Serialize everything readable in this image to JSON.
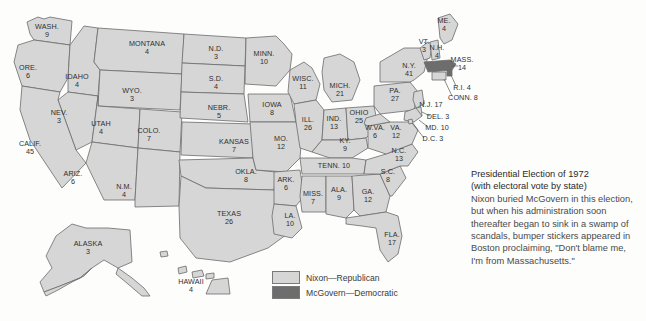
{
  "figure": {
    "title": "Presidential Election of 1972",
    "subtitle": "(with electoral vote by state)",
    "body": "Nixon buried McGovern in this election, but when his administration soon thereafter began to sink in a swamp of scandals, bumper stickers appeared in Boston proclaiming, \"Don't blame me, I'm from Massachusetts.\""
  },
  "legend": {
    "items": [
      {
        "label": "Nixon—Republican",
        "swatch": "rep",
        "color": "#d6d6d6"
      },
      {
        "label": "McGovern—Democratic",
        "swatch": "dem",
        "color": "#6d6d6d"
      }
    ]
  },
  "colors": {
    "republican": "#d6d6d6",
    "democratic": "#6d6d6d",
    "border": "#6b6b6b",
    "background": "#fdfdfc",
    "text": "#2e2e2e"
  },
  "chart_data": {
    "type": "map",
    "title": "Presidential Election of 1972",
    "subtitle": "(with electoral vote by state)",
    "value_label": "electoral votes",
    "categories": [
      "Nixon—Republican",
      "McGovern—Democratic"
    ],
    "states": [
      {
        "name": "WASH.",
        "votes": 9,
        "winner": "Nixon",
        "x": 47,
        "y": 31
      },
      {
        "name": "ORE.",
        "votes": 6,
        "winner": "Nixon",
        "x": 28,
        "y": 72
      },
      {
        "name": "IDAHO",
        "votes": 4,
        "winner": "Nixon",
        "x": 77,
        "y": 81
      },
      {
        "name": "MONTANA",
        "votes": 4,
        "winner": "Nixon",
        "x": 147,
        "y": 48
      },
      {
        "name": "WYO.",
        "votes": 3,
        "winner": "Nixon",
        "x": 132,
        "y": 95
      },
      {
        "name": "NEV.",
        "votes": 3,
        "winner": "Nixon",
        "x": 59,
        "y": 117
      },
      {
        "name": "UTAH",
        "votes": 4,
        "winner": "Nixon",
        "x": 101,
        "y": 128
      },
      {
        "name": "CALIF.",
        "votes": 45,
        "winner": "Nixon",
        "x": 30,
        "y": 148
      },
      {
        "name": "ARIZ.",
        "votes": 6,
        "winner": "Nixon",
        "x": 73,
        "y": 178
      },
      {
        "name": "COLO.",
        "votes": 7,
        "winner": "Nixon",
        "x": 149,
        "y": 135
      },
      {
        "name": "N.M.",
        "votes": 4,
        "winner": "Nixon",
        "x": 124,
        "y": 191
      },
      {
        "name": "N.D.",
        "votes": 3,
        "winner": "Nixon",
        "x": 216,
        "y": 53
      },
      {
        "name": "S.D.",
        "votes": 4,
        "winner": "Nixon",
        "x": 216,
        "y": 83
      },
      {
        "name": "NEBR.",
        "votes": 5,
        "winner": "Nixon",
        "x": 219,
        "y": 112
      },
      {
        "name": "KANSAS",
        "votes": 7,
        "winner": "Nixon",
        "x": 234,
        "y": 146
      },
      {
        "name": "OKLA.",
        "votes": 8,
        "winner": "Nixon",
        "x": 246,
        "y": 176
      },
      {
        "name": "TEXAS",
        "votes": 26,
        "winner": "Nixon",
        "x": 229,
        "y": 218
      },
      {
        "name": "MINN.",
        "votes": 10,
        "winner": "Nixon",
        "x": 264,
        "y": 58
      },
      {
        "name": "IOWA",
        "votes": 8,
        "winner": "Nixon",
        "x": 272,
        "y": 109
      },
      {
        "name": "MO.",
        "votes": 12,
        "winner": "Nixon",
        "x": 281,
        "y": 143
      },
      {
        "name": "ARK.",
        "votes": 6,
        "winner": "Nixon",
        "x": 286,
        "y": 184
      },
      {
        "name": "LA.",
        "votes": 10,
        "winner": "Nixon",
        "x": 290,
        "y": 220
      },
      {
        "name": "WISC.",
        "votes": 11,
        "winner": "Nixon",
        "x": 303,
        "y": 83
      },
      {
        "name": "ILL.",
        "votes": 26,
        "winner": "Nixon",
        "x": 308,
        "y": 124
      },
      {
        "name": "MICH.",
        "votes": 21,
        "winner": "Nixon",
        "x": 340,
        "y": 90
      },
      {
        "name": "IND.",
        "votes": 13,
        "winner": "Nixon",
        "x": 334,
        "y": 123
      },
      {
        "name": "OHIO",
        "votes": 25,
        "winner": "Nixon",
        "x": 359,
        "y": 117
      },
      {
        "name": "KY.",
        "votes": 9,
        "winner": "Nixon",
        "x": 345,
        "y": 145
      },
      {
        "name": "TENN.",
        "votes": 10,
        "winner": "Nixon",
        "x": 334,
        "y": 166,
        "inline": true
      },
      {
        "name": "MISS.",
        "votes": 7,
        "winner": "Nixon",
        "x": 313,
        "y": 198
      },
      {
        "name": "ALA.",
        "votes": 9,
        "winner": "Nixon",
        "x": 339,
        "y": 194
      },
      {
        "name": "GA.",
        "votes": 12,
        "winner": "Nixon",
        "x": 368,
        "y": 196
      },
      {
        "name": "FLA.",
        "votes": 17,
        "winner": "Nixon",
        "x": 392,
        "y": 239
      },
      {
        "name": "S.C.",
        "votes": 8,
        "winner": "Nixon",
        "x": 388,
        "y": 176
      },
      {
        "name": "N.C.",
        "votes": 13,
        "winner": "Nixon",
        "x": 399,
        "y": 155
      },
      {
        "name": "VA.",
        "votes": 12,
        "winner": "Nixon",
        "x": 396,
        "y": 132
      },
      {
        "name": "W.VA.",
        "votes": 6,
        "winner": "Nixon",
        "x": 375,
        "y": 132
      },
      {
        "name": "PA.",
        "votes": 27,
        "winner": "Nixon",
        "x": 395,
        "y": 95
      },
      {
        "name": "N.Y.",
        "votes": 41,
        "winner": "Nixon",
        "x": 409,
        "y": 70
      },
      {
        "name": "VT.",
        "votes": 3,
        "winner": "Nixon",
        "x": 424,
        "y": 46
      },
      {
        "name": "N.H.",
        "votes": 4,
        "winner": "Nixon",
        "x": 437,
        "y": 52
      },
      {
        "name": "ME.",
        "votes": 4,
        "winner": "Nixon",
        "x": 444,
        "y": 25
      },
      {
        "name": "MASS.",
        "votes": 14,
        "winner": "McGovern",
        "x": 462,
        "y": 64
      },
      {
        "name": "R.I.",
        "votes": 4,
        "winner": "Nixon",
        "x": 462,
        "y": 88,
        "inline": true
      },
      {
        "name": "CONN.",
        "votes": 8,
        "winner": "Nixon",
        "x": 463,
        "y": 98,
        "inline": true
      },
      {
        "name": "N.J.",
        "votes": 17,
        "winner": "Nixon",
        "x": 431,
        "y": 105,
        "inline": true
      },
      {
        "name": "DEL.",
        "votes": 3,
        "winner": "Nixon",
        "x": 438,
        "y": 117,
        "inline": true
      },
      {
        "name": "MD.",
        "votes": 10,
        "winner": "Nixon",
        "x": 437,
        "y": 128,
        "inline": true
      },
      {
        "name": "D.C.",
        "votes": 3,
        "winner": "McGovern",
        "x": 433,
        "y": 139,
        "inline": true
      },
      {
        "name": "ALASKA",
        "votes": 3,
        "winner": "Nixon",
        "x": 88,
        "y": 248
      },
      {
        "name": "HAWAII",
        "votes": 4,
        "winner": "Nixon",
        "x": 191,
        "y": 286
      }
    ]
  }
}
